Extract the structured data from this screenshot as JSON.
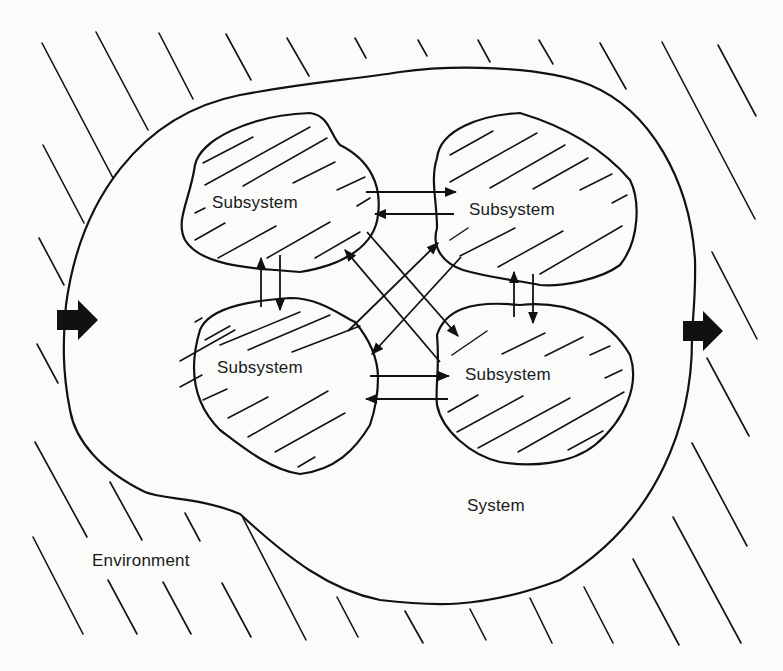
{
  "diagram": {
    "type": "system-environment-diagram",
    "labels": {
      "environment": "Environment",
      "system": "System",
      "subsystems": [
        "Subsystem",
        "Subsystem",
        "Subsystem",
        "Subsystem"
      ]
    },
    "nodes": [
      {
        "id": "subsystem-top-left",
        "label": "Subsystem"
      },
      {
        "id": "subsystem-top-right",
        "label": "Subsystem"
      },
      {
        "id": "subsystem-bottom-left",
        "label": "Subsystem"
      },
      {
        "id": "subsystem-bottom-right",
        "label": "Subsystem"
      }
    ],
    "edges": [
      {
        "from": "subsystem-top-left",
        "to": "subsystem-top-right",
        "bidirectional": true
      },
      {
        "from": "subsystem-top-left",
        "to": "subsystem-bottom-left",
        "bidirectional": true
      },
      {
        "from": "subsystem-top-right",
        "to": "subsystem-bottom-right",
        "bidirectional": true
      },
      {
        "from": "subsystem-bottom-left",
        "to": "subsystem-bottom-right",
        "bidirectional": true
      },
      {
        "from": "subsystem-top-left",
        "to": "subsystem-bottom-right",
        "bidirectional": true
      },
      {
        "from": "subsystem-top-right",
        "to": "subsystem-bottom-left",
        "bidirectional": true
      }
    ],
    "flows": {
      "input": {
        "direction": "right",
        "label": "input-arrow"
      },
      "output": {
        "direction": "right",
        "label": "output-arrow"
      }
    },
    "colors": {
      "ink": "#111111",
      "paper": "#fbfbfa"
    }
  }
}
